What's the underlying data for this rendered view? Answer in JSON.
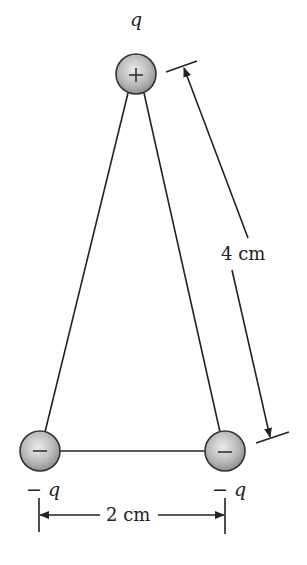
{
  "figure": {
    "type": "charge-triangle",
    "charges": [
      {
        "id": "top",
        "label": "q",
        "sign_glyph": "+",
        "cx": 136,
        "cy": 74
      },
      {
        "id": "bottom-left",
        "label": "− q",
        "sign_glyph": "−",
        "cx": 40,
        "cy": 451
      },
      {
        "id": "bottom-right",
        "label": "− q",
        "sign_glyph": "−",
        "cx": 225,
        "cy": 451
      }
    ],
    "dimensions": {
      "side": "4 cm",
      "base": "2 cm"
    },
    "colors": {
      "line": "#222222",
      "sphere_light": "#e8e8e8",
      "sphere_dark": "#8a8a8a"
    }
  }
}
